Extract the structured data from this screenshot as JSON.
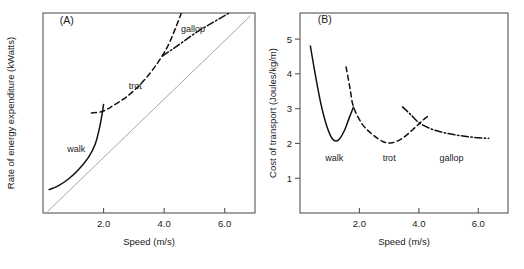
{
  "figure": {
    "panels": [
      {
        "tag": "(A)",
        "xlabel": "Speed (m/s)",
        "ylabel": "Rate of energy expenditure (kWatts)",
        "xticks": [
          "2.0",
          "4.0",
          "6.0"
        ],
        "yticks": [],
        "gaits": [
          "walk",
          "trot",
          "gallop"
        ]
      },
      {
        "tag": "(B)",
        "xlabel": "Speed (m/s)",
        "ylabel": "Cost of transport (Joules/kg/m)",
        "xticks": [
          "2.0",
          "4.0",
          "6.0"
        ],
        "yticks": [
          "1",
          "2",
          "3",
          "4",
          "5"
        ],
        "gaits": [
          "walk",
          "trot",
          "gallop"
        ]
      }
    ]
  },
  "chart_data": [
    {
      "type": "line",
      "title": "(A)",
      "xlabel": "Speed (m/s)",
      "ylabel": "Rate of energy expenditure (kWatts)",
      "xlim": [
        0.0,
        7.0
      ],
      "ylim": [
        0.0,
        7.0
      ],
      "xticks": [
        2.0,
        4.0,
        6.0
      ],
      "xticklabels": [
        "2.0",
        "4.0",
        "6.0"
      ],
      "yticks": [],
      "yticklabels": [],
      "grid": false,
      "legend": "none",
      "annotations": [
        {
          "text": "(A)",
          "x": 0.55,
          "y": 6.6
        },
        {
          "text": "walk",
          "x": 1.1,
          "y": 2.15
        },
        {
          "text": "trot",
          "x": 3.05,
          "y": 4.35
        },
        {
          "text": "gallop",
          "x": 4.95,
          "y": 6.35
        }
      ],
      "series": [
        {
          "name": "reference-line",
          "style": "thin-solid",
          "color": "#9a9a9a",
          "x": [
            0.15,
            6.85
          ],
          "y": [
            0.05,
            6.9
          ]
        },
        {
          "name": "walk",
          "style": "solid",
          "color": "#111111",
          "x": [
            0.2,
            0.5,
            0.85,
            1.2,
            1.5,
            1.72,
            1.86,
            1.95,
            2.0
          ],
          "y": [
            0.82,
            0.95,
            1.2,
            1.55,
            1.95,
            2.4,
            2.95,
            3.45,
            3.8
          ]
        },
        {
          "name": "trot",
          "style": "dashed",
          "color": "#111111",
          "x": [
            1.6,
            1.95,
            2.3,
            2.8,
            3.3,
            3.75,
            4.1,
            4.35,
            4.55,
            4.7
          ],
          "y": [
            3.5,
            3.55,
            3.75,
            4.1,
            4.6,
            5.2,
            5.8,
            6.4,
            6.95,
            7.35
          ]
        },
        {
          "name": "gallop",
          "style": "dashdot",
          "color": "#111111",
          "x": [
            3.95,
            4.3,
            4.7,
            5.1,
            5.5,
            5.9,
            6.3,
            6.7
          ],
          "y": [
            5.5,
            5.75,
            6.05,
            6.35,
            6.6,
            6.85,
            7.1,
            7.35
          ]
        }
      ]
    },
    {
      "type": "line",
      "title": "(B)",
      "xlabel": "Speed (m/s)",
      "ylabel": "Cost of transport (Joules/kg/m)",
      "xlim": [
        0.0,
        7.0
      ],
      "ylim": [
        0.0,
        5.75
      ],
      "xticks": [
        2.0,
        4.0,
        6.0
      ],
      "xticklabels": [
        "2.0",
        "4.0",
        "6.0"
      ],
      "yticks": [
        1,
        2,
        3,
        4,
        5
      ],
      "yticklabels": [
        "1",
        "2",
        "3",
        "4",
        "5"
      ],
      "grid": false,
      "legend": "none",
      "annotations": [
        {
          "text": "(B)",
          "x": 0.6,
          "y": 5.45
        },
        {
          "text": "walk",
          "x": 1.15,
          "y": 1.5
        },
        {
          "text": "trot",
          "x": 3.0,
          "y": 1.5
        },
        {
          "text": "gallop",
          "x": 5.1,
          "y": 1.5
        }
      ],
      "series": [
        {
          "name": "walk",
          "style": "solid",
          "color": "#111111",
          "x": [
            0.35,
            0.5,
            0.7,
            0.9,
            1.1,
            1.3,
            1.5,
            1.65,
            1.8
          ],
          "y": [
            4.8,
            4.05,
            3.15,
            2.5,
            2.12,
            2.1,
            2.38,
            2.72,
            3.05
          ]
        },
        {
          "name": "trot",
          "style": "dashed",
          "color": "#111111",
          "x": [
            1.55,
            1.68,
            1.8,
            2.1,
            2.45,
            2.8,
            3.1,
            3.45,
            3.8,
            4.05,
            4.25,
            4.35
          ],
          "y": [
            4.2,
            3.6,
            3.05,
            2.55,
            2.25,
            2.05,
            2.02,
            2.15,
            2.4,
            2.6,
            2.75,
            2.8
          ]
        },
        {
          "name": "gallop",
          "style": "dashdot",
          "color": "#111111",
          "x": [
            3.45,
            3.7,
            4.0,
            4.4,
            4.8,
            5.2,
            5.6,
            6.0,
            6.35
          ],
          "y": [
            3.05,
            2.85,
            2.6,
            2.42,
            2.32,
            2.25,
            2.2,
            2.16,
            2.15
          ]
        }
      ]
    }
  ]
}
